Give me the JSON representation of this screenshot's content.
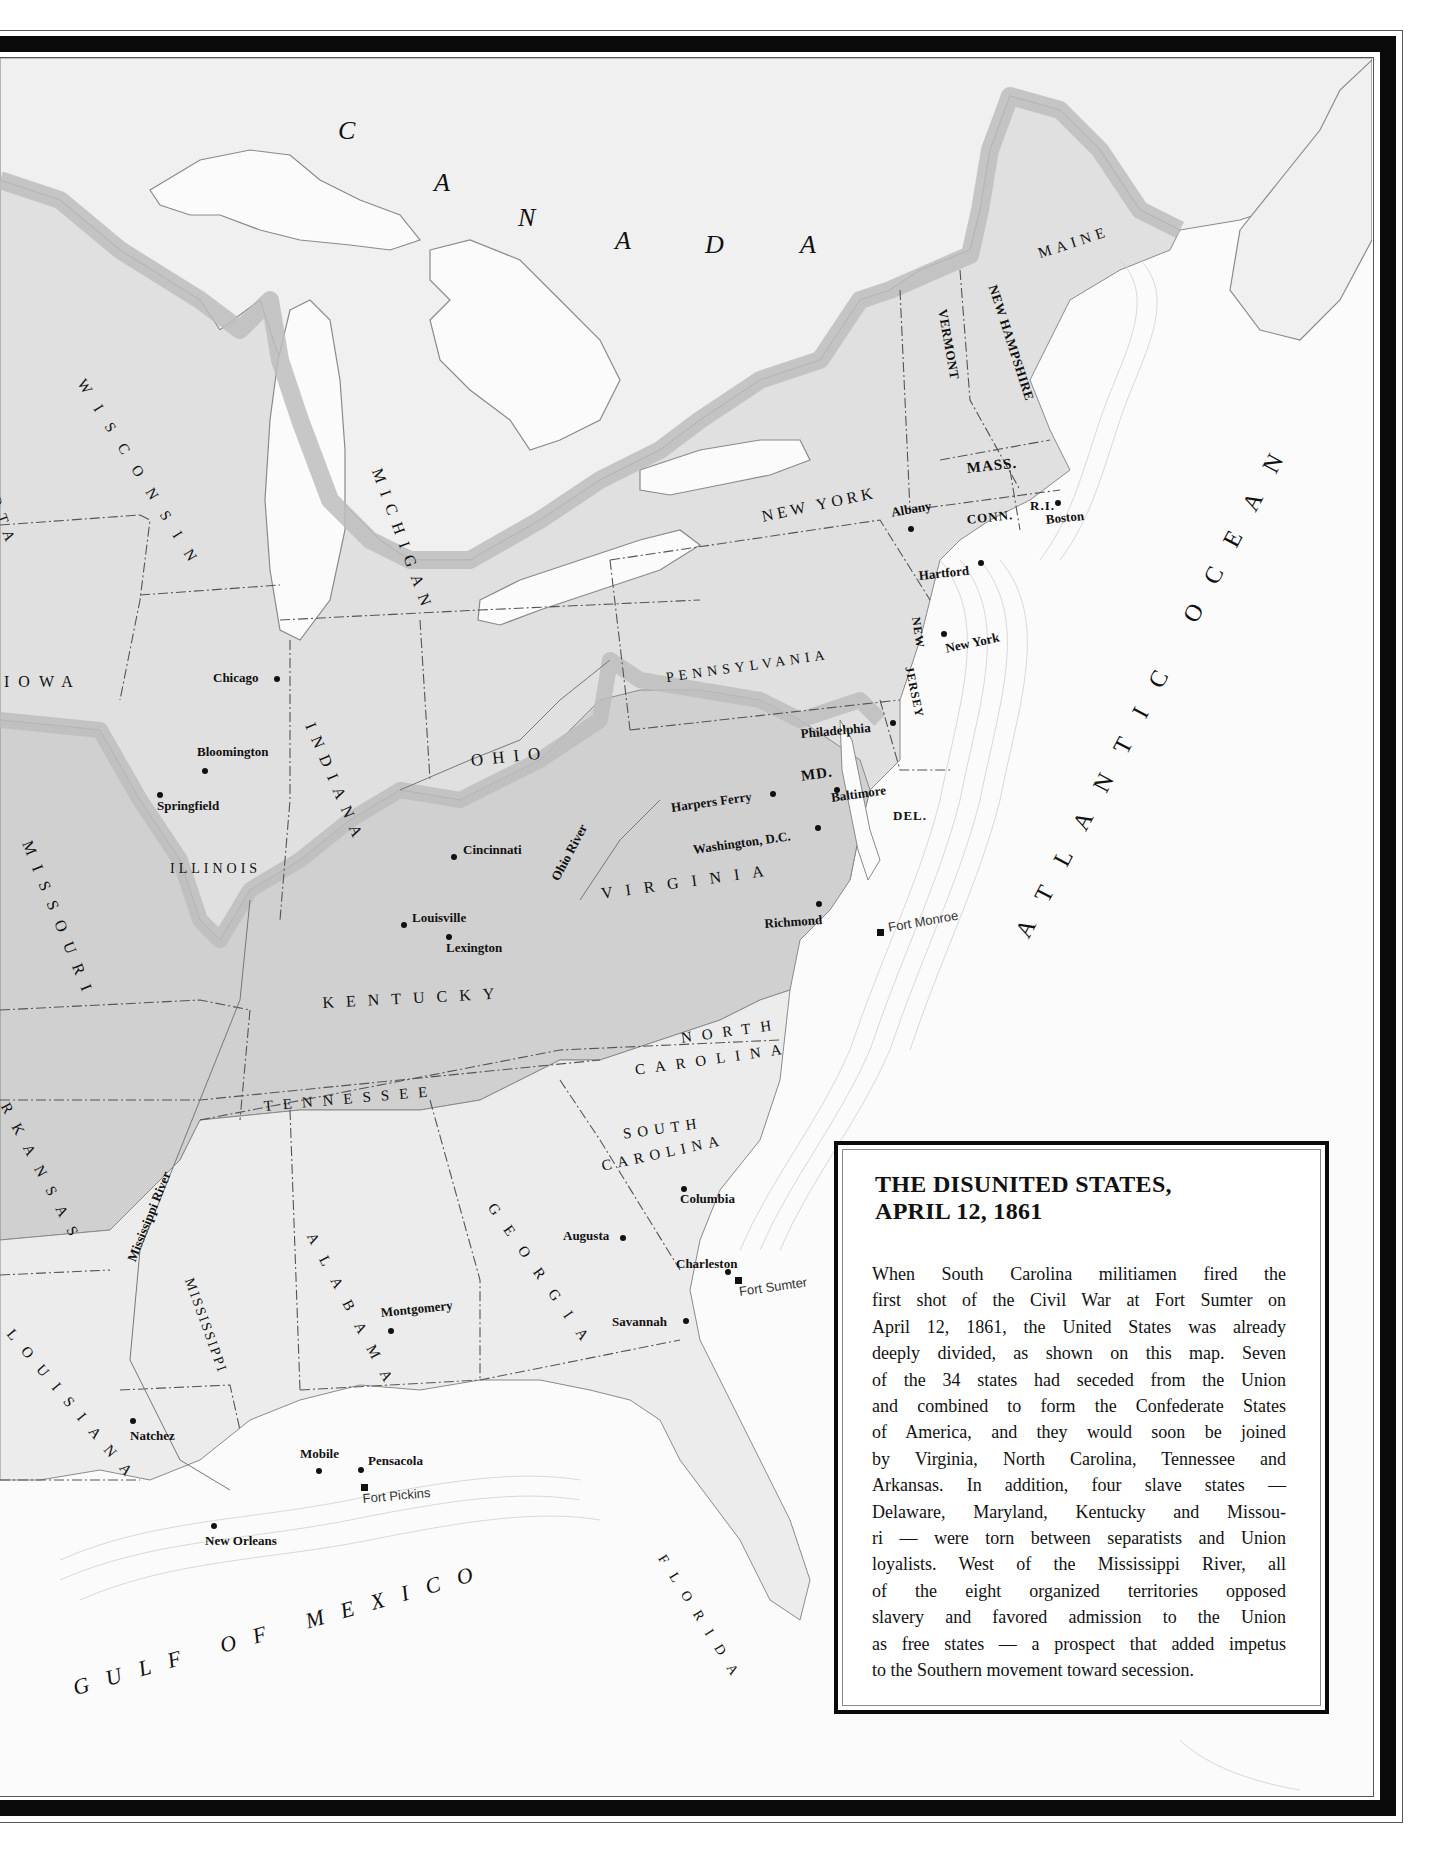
{
  "infobox": {
    "title_line1": "THE DISUNITED STATES,",
    "title_line2": "APRIL 12, 1861",
    "body_lines": [
      "When South Carolina militiamen fired the",
      "first shot of the Civil War at Fort Sumter on",
      "April 12, 1861, the United States was already",
      "deeply divided, as shown on this map. Seven",
      "of the 34 states had seceded from the Union",
      "and combined to form the Confederate States",
      "of America, and they would soon be joined",
      "by Virginia, North Carolina, Tennessee and",
      "Arkansas. In addition, four slave states —",
      "Delaware, Maryland, Kentucky and Missou-",
      "ri — were torn between separatists and Union",
      "loyalists. West of the Mississippi River, all",
      "of the eight organized territories opposed",
      "slavery and favored admission to the Union",
      "as free states — a prospect that added impetus",
      "to the Southern movement toward secession."
    ]
  },
  "colors": {
    "union": "#e0e0e0",
    "upper_south": "#d0d0d0",
    "confederate": "#ececec",
    "foreign": "#f0f0f0",
    "water": "#fbfbfb",
    "boundary_band": "#bdbdbd",
    "frame": "#0a0a0a"
  },
  "regions": {
    "canada": "CANADA",
    "atlantic": "ATLANTIC OCEAN",
    "gulf": "GULF OF MEXICO"
  },
  "states": {
    "maine": "MAINE",
    "new_hampshire": "NEW HAMPSHIRE",
    "vermont": "VERMONT",
    "new_york": "NEW YORK",
    "mass": "MASS.",
    "conn": "CONN.",
    "ri": "R.I.",
    "pennsylvania": "PENNSYLVANIA",
    "new_jersey_1": "NEW",
    "new_jersey_2": "JERSEY",
    "md": "MD.",
    "del": "DEL.",
    "ohio": "OHIO",
    "michigan": "MICHIGAN",
    "indiana": "INDIANA",
    "illinois": "ILLINOIS",
    "wisconsin": "WISCONSIN",
    "iowa": "IOWA",
    "minnesota_partial": "OTA",
    "missouri": "MISSOURI",
    "kentucky": "KENTUCKY",
    "virginia": "VIRGINIA",
    "north_carolina_1": "NORTH",
    "north_carolina_2": "CAROLINA",
    "tennessee": "TENNESSEE",
    "arkansas_partial": "RKANSAS",
    "south_carolina_1": "SOUTH",
    "south_carolina_2": "CAROLINA",
    "georgia": "GEORGIA",
    "alabama": "ALABAMA",
    "mississippi": "MISSISSIPPI",
    "louisiana_partial": "LOUISIANA",
    "florida": "FLORIDA"
  },
  "rivers": {
    "ohio": "Ohio River",
    "mississippi": "Mississippi River"
  },
  "cities": {
    "albany": "Albany",
    "boston": "Boston",
    "hartford": "Hartford",
    "new_york": "New York",
    "philadelphia": "Philadelphia",
    "harpers_ferry": "Harpers Ferry",
    "baltimore": "Baltimore",
    "washington": "Washington, D.C.",
    "richmond": "Richmond",
    "chicago": "Chicago",
    "bloomington": "Bloomington",
    "springfield": "Springfield",
    "cincinnati": "Cincinnati",
    "louisville": "Louisville",
    "lexington": "Lexington",
    "columbia": "Columbia",
    "augusta": "Augusta",
    "charleston": "Charleston",
    "savannah": "Savannah",
    "montgomery": "Montgomery",
    "natchez": "Natchez",
    "mobile": "Mobile",
    "pensacola": "Pensacola",
    "new_orleans": "New Orleans"
  },
  "forts": {
    "monroe": "Fort Monroe",
    "sumter": "Fort Sumter",
    "pickins": "Fort Pickins"
  }
}
